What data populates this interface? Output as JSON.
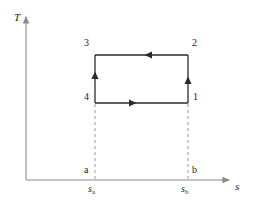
{
  "figure": {
    "type": "T-s diagram (Carnot cycle)",
    "axes": {
      "y_label": "T",
      "x_label": "s",
      "origin_x": 26,
      "origin_y": 180,
      "x_end": 232,
      "y_top": 14
    },
    "cycle": {
      "left": 95,
      "right": 188,
      "top": 55,
      "bottom": 103,
      "states": [
        {
          "id": "1",
          "label": "1",
          "x": 188,
          "y": 103,
          "label_x": 193,
          "label_y": 96
        },
        {
          "id": "2",
          "label": "2",
          "x": 188,
          "y": 55,
          "label_x": 192,
          "label_y": 42
        },
        {
          "id": "3",
          "label": "3",
          "x": 95,
          "y": 55,
          "label_x": 84,
          "label_y": 42
        },
        {
          "id": "4",
          "label": "4",
          "x": 95,
          "y": 103,
          "label_x": 84,
          "label_y": 96
        }
      ],
      "process_arrows": [
        {
          "from": "4",
          "to": "1",
          "edge": "bottom",
          "direction": "right"
        },
        {
          "from": "1",
          "to": "2",
          "edge": "right",
          "direction": "up"
        },
        {
          "from": "2",
          "to": "3",
          "edge": "top",
          "direction": "left"
        },
        {
          "from": "3",
          "to": "4",
          "edge": "left",
          "direction": "up"
        }
      ]
    },
    "guides": [
      {
        "id": "a",
        "x": 95,
        "axis_mark": "a",
        "tick_label": "s",
        "tick_sub": "a"
      },
      {
        "id": "b",
        "x": 188,
        "axis_mark": "b",
        "tick_label": "s",
        "tick_sub": "b"
      }
    ],
    "colors": {
      "line": "#2b2b2b",
      "axis": "#8a8a8a",
      "dashed": "#9a9a9a",
      "text": "#1a1a1a",
      "background": "#ffffff"
    }
  }
}
